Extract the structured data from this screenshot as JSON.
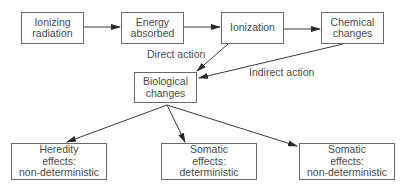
{
  "nodes": {
    "ionizing_radiation": {
      "label": "Ionizing\nradiation"
    },
    "energy_absorbed": {
      "label": "Energy\nabsorbed"
    },
    "ionization": {
      "label": "Ionization"
    },
    "chemical_changes": {
      "label": "Chemical\nchanges"
    },
    "biological_changes": {
      "label": "Biological\nchanges"
    },
    "heredity_effects": {
      "label": "Heredity\neffects:\nnon-deterministic"
    },
    "somatic_deterministic": {
      "label": "Somatic\neffects:\ndeterministic"
    },
    "somatic_nondeterministic": {
      "label": "Somatic\neffects:\nnon-deterministic"
    }
  },
  "edge_labels": {
    "direct_action": "Direct action",
    "indirect_action": "Indirect action"
  },
  "edges": [
    {
      "from": "ionizing_radiation",
      "to": "energy_absorbed"
    },
    {
      "from": "energy_absorbed",
      "to": "ionization"
    },
    {
      "from": "ionization",
      "to": "chemical_changes"
    },
    {
      "from": "ionization",
      "to": "biological_changes",
      "label": "Direct action"
    },
    {
      "from": "chemical_changes",
      "to": "biological_changes",
      "label": "Indirect action"
    },
    {
      "from": "biological_changes",
      "to": "heredity_effects"
    },
    {
      "from": "biological_changes",
      "to": "somatic_deterministic"
    },
    {
      "from": "biological_changes",
      "to": "somatic_nondeterministic"
    }
  ],
  "colors": {
    "stroke": "#3a3a3a",
    "text": "#4a4a4a",
    "border": "#6a6a6a"
  }
}
